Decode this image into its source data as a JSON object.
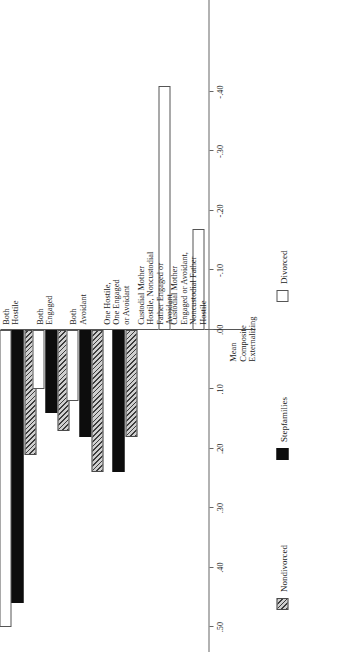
{
  "chart_data": {
    "type": "bar",
    "orientation": "horizontal",
    "title": "",
    "xlabel": "Mean\nComposite\nExternalizing",
    "ylabel": "",
    "xlim": [
      -0.45,
      0.55
    ],
    "grid": false,
    "legend_position": "bottom",
    "axis_title": "Mean\nComposite\nExternalizing",
    "tick_labels": [
      ".50",
      ".40",
      ".30",
      ".20",
      ".10",
      ".00",
      "-.10",
      "-.20",
      "-.30",
      "-.40"
    ],
    "tick_values": [
      0.5,
      0.4,
      0.3,
      0.2,
      0.1,
      0.0,
      -0.1,
      -0.2,
      -0.3,
      -0.4
    ],
    "categories": [
      "Both\nHostile",
      "Both\nEngaged",
      "Both\nAvoidant",
      "One Hostile,\nOne Engaged\nor Avoidant",
      "Custodial  Mother\nHostile, Noncustodial\nFather Engaged or\nAvoidant",
      "Custodial  Mother\nEngaged or Avoidant,\nNoncustodial Father\nHostile"
    ],
    "series": [
      {
        "name": "Divorced",
        "pattern": "dotted",
        "color": "#ffffff",
        "values": [
          0.5,
          0.1,
          0.12,
          null,
          -0.41,
          -0.17
        ]
      },
      {
        "name": "Stepfamilies",
        "pattern": "solid-black",
        "color": "#0d0d0d",
        "values": [
          0.46,
          0.14,
          0.18,
          0.24,
          null,
          null
        ]
      },
      {
        "name": "Nondivorced",
        "pattern": "diagonal-hatch",
        "color": "#cfcfcf",
        "values": [
          0.21,
          0.17,
          0.24,
          0.18,
          null,
          null
        ]
      }
    ]
  },
  "legend": {
    "items": [
      {
        "label": "Nondivorced"
      },
      {
        "label": "Stepfamilies"
      },
      {
        "label": "Divorced"
      }
    ]
  }
}
